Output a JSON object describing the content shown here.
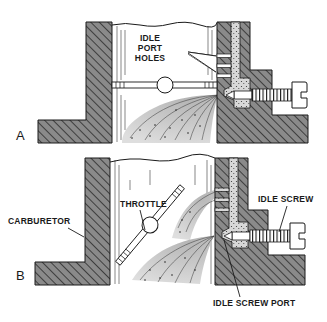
{
  "figure": {
    "panels": [
      {
        "id": "A",
        "panel_label": "A",
        "throttle_state": "closed",
        "labels": {
          "idle_port_holes_line1": "IDLE",
          "idle_port_holes_line2": "PORT",
          "idle_port_holes_line3": "HOLES"
        }
      },
      {
        "id": "B",
        "panel_label": "B",
        "throttle_state": "partially open",
        "labels": {
          "throttle": "THROTTLE",
          "carburetor": "CARBURETOR",
          "idle_screw": "IDLE SCREW",
          "idle_screw_port": "IDLE SCREW PORT"
        }
      }
    ],
    "colors": {
      "line": "#1a1a1a",
      "hatch_fill": "#8a8a8a",
      "spray": "#c8c8c8",
      "background": "#ffffff"
    }
  }
}
